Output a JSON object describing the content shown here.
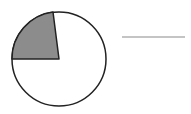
{
  "diagram": {
    "type": "fraction-circle",
    "circle": {
      "cx": 59,
      "cy": 59,
      "r": 47,
      "fill": "#ffffff",
      "stroke": "#222222",
      "stroke_width": 1.5
    },
    "shaded_sector": {
      "start_point": [
        12,
        59
      ],
      "end_point": [
        53,
        12
      ],
      "approx_angle_deg": 83,
      "approx_fraction_of_circle": 0.23,
      "fill": "#8c8c8c",
      "stroke": "#222222"
    },
    "answer_line": {
      "x1": 122,
      "y1": 37,
      "x2": 185,
      "y2": 37,
      "stroke": "#8a8a8a",
      "stroke_width": 1.2
    }
  }
}
